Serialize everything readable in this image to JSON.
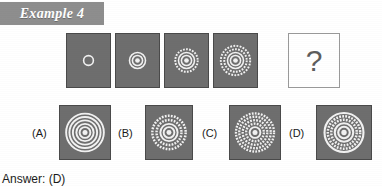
{
  "header": {
    "label": "Example 4",
    "banner_color": "#8e8e8e",
    "text_color": "#ffffff"
  },
  "colors": {
    "panel_fill": "#6e6e6e",
    "panel_border": "#4a4a4a",
    "ring_stroke": "#f2f2f2",
    "blank_fill": "#ffffff",
    "text": "#1a1a1a"
  },
  "sequence": {
    "name": "concentric-ring-progression",
    "panels": [
      {
        "index": 1,
        "icon": "concentric-rings-1",
        "ring_count": 1,
        "rings": [
          {
            "radius": 5,
            "style": "solid",
            "width": 1.6
          }
        ]
      },
      {
        "index": 2,
        "icon": "concentric-rings-2",
        "ring_count": 3,
        "rings": [
          {
            "radius": 2.4,
            "style": "dot",
            "width": 2.4
          },
          {
            "radius": 5.2,
            "style": "solid",
            "width": 1.6
          },
          {
            "radius": 8.2,
            "style": "solid",
            "width": 1.6
          }
        ]
      },
      {
        "index": 3,
        "icon": "concentric-rings-3",
        "ring_count": 4,
        "rings": [
          {
            "radius": 2.4,
            "style": "dot",
            "width": 2.4
          },
          {
            "radius": 5.2,
            "style": "solid",
            "width": 1.6
          },
          {
            "radius": 8.2,
            "style": "solid",
            "width": 1.6
          },
          {
            "radius": 11.5,
            "style": "dashed",
            "width": 2.0
          }
        ]
      },
      {
        "index": 4,
        "icon": "concentric-rings-4",
        "ring_count": 5,
        "rings": [
          {
            "radius": 2.4,
            "style": "dot",
            "width": 2.4
          },
          {
            "radius": 5.2,
            "style": "solid",
            "width": 1.6
          },
          {
            "radius": 8.2,
            "style": "solid",
            "width": 1.6
          },
          {
            "radius": 11.5,
            "style": "dashed",
            "width": 2.0
          },
          {
            "radius": 15.0,
            "style": "dashed",
            "width": 2.0
          }
        ]
      },
      {
        "index": 5,
        "icon": "question-mark",
        "label": "?",
        "blank": true
      }
    ]
  },
  "options": [
    {
      "key": "A",
      "label": "(A)",
      "icon": "concentric-rings-option-a",
      "description": "five solid concentric rings",
      "rings": [
        {
          "radius": 2.6,
          "style": "dot",
          "width": 2.6
        },
        {
          "radius": 5.6,
          "style": "solid",
          "width": 2.0
        },
        {
          "radius": 9.0,
          "style": "solid",
          "width": 2.0
        },
        {
          "radius": 12.6,
          "style": "solid",
          "width": 2.0
        },
        {
          "radius": 16.2,
          "style": "solid",
          "width": 2.0
        },
        {
          "radius": 19.6,
          "style": "solid",
          "width": 2.0
        }
      ]
    },
    {
      "key": "B",
      "label": "(B)",
      "icon": "concentric-rings-option-b",
      "description": "solid core with two dashed outer rings",
      "rings": [
        {
          "radius": 2.6,
          "style": "dot",
          "width": 2.6
        },
        {
          "radius": 5.6,
          "style": "solid",
          "width": 2.0
        },
        {
          "radius": 9.0,
          "style": "solid",
          "width": 2.0
        },
        {
          "radius": 13.0,
          "style": "dashed",
          "width": 2.6
        },
        {
          "radius": 17.4,
          "style": "dashed",
          "width": 2.6
        }
      ]
    },
    {
      "key": "C",
      "label": "(C)",
      "icon": "concentric-rings-option-c",
      "description": "dense dashed rings throughout",
      "rings": [
        {
          "radius": 2.6,
          "style": "dot",
          "width": 2.6
        },
        {
          "radius": 5.6,
          "style": "solid",
          "width": 2.0
        },
        {
          "radius": 9.2,
          "style": "dashed",
          "width": 2.4
        },
        {
          "radius": 12.8,
          "style": "dashed",
          "width": 2.4
        },
        {
          "radius": 16.4,
          "style": "dashed",
          "width": 2.4
        },
        {
          "radius": 19.8,
          "style": "dashed",
          "width": 2.4
        }
      ]
    },
    {
      "key": "D",
      "label": "(D)",
      "icon": "concentric-rings-option-d",
      "description": "solid inner rings with dashed outer rings",
      "rings": [
        {
          "radius": 2.8,
          "style": "dot",
          "width": 2.8
        },
        {
          "radius": 6.0,
          "style": "solid",
          "width": 2.2
        },
        {
          "radius": 9.6,
          "style": "solid",
          "width": 2.2
        },
        {
          "radius": 13.2,
          "style": "dashed",
          "width": 2.6
        },
        {
          "radius": 16.8,
          "style": "dashed",
          "width": 2.6
        },
        {
          "radius": 20.2,
          "style": "solid",
          "width": 2.2
        }
      ]
    }
  ],
  "answer": {
    "text": "Answer: (D)"
  }
}
